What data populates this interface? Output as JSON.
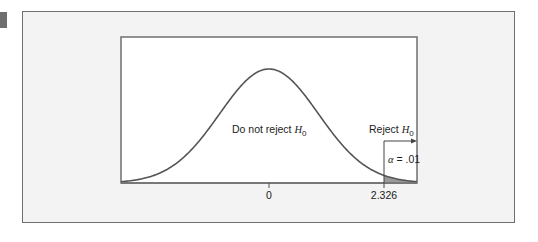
{
  "chart_data": {
    "type": "line",
    "title": "",
    "distribution": "standard normal",
    "mean": 0,
    "sd": 1,
    "xlim": [
      -3.0,
      3.0
    ],
    "tick_labels": [
      "0",
      "2.326"
    ],
    "ticks": [
      0,
      2.326
    ],
    "critical_value": 2.326,
    "alpha": 0.01,
    "regions": [
      {
        "name": "Do not reject H0",
        "range": [
          -3.0,
          2.326
        ],
        "shaded": false
      },
      {
        "name": "Reject H0",
        "range": [
          2.326,
          3.0
        ],
        "shaded": true,
        "area": 0.01
      }
    ],
    "annotations": [
      {
        "text": "Do not reject H",
        "subscript": "0",
        "position": "center"
      },
      {
        "text": "Reject H",
        "subscript": "0",
        "position": "right tail, arrow pointing right"
      },
      {
        "text": "α = .01",
        "position": "right tail"
      }
    ],
    "xlabel": "",
    "ylabel": "",
    "grid": false,
    "legend": false
  },
  "labels": {
    "do_not_reject": "Do not reject ",
    "reject": "Reject ",
    "h": "H",
    "sub0": "0",
    "alpha_symbol": "α",
    "alpha_value": " = .01",
    "tick_zero": "0",
    "tick_critical": "2.326"
  },
  "colors": {
    "curve": "#555555",
    "shade": "#9a9a9a",
    "axis": "#6f6f6f",
    "panel": "#f3f3f3",
    "plot_bg": "#ffffff"
  }
}
